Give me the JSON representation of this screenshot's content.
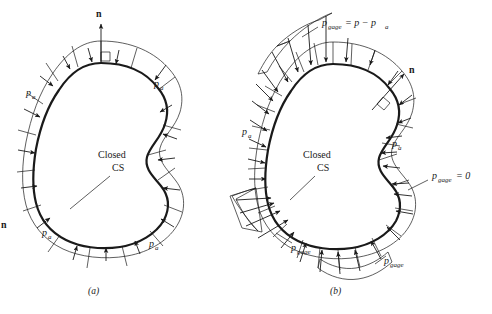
{
  "figure": {
    "type": "pressure-distribution-on-closed-control-surface",
    "background_color": "#ffffff",
    "line_color": "#1a1a1a",
    "stray_left_label": "n"
  },
  "panels": [
    {
      "id": "a",
      "caption": "(a)",
      "caption_x": 91,
      "caption_y": 291,
      "normal_vector": {
        "label": "n",
        "x": 101,
        "y": 20,
        "direction": "up"
      },
      "interior_label": {
        "line1": "Closed",
        "line2": "CS",
        "x": 120,
        "y": 160
      },
      "pressure_labels": [
        {
          "base": "p",
          "sub": "a",
          "x": 30,
          "y": 92
        },
        {
          "base": "p",
          "sub": "a",
          "x": 158,
          "y": 83
        },
        {
          "base": "p",
          "sub": "a",
          "x": 46,
          "y": 232
        },
        {
          "base": "p",
          "sub": "a",
          "x": 153,
          "y": 243
        }
      ],
      "description": "Uniform atmospheric pressure p_a acting inward everywhere on the closed control surface"
    },
    {
      "id": "b",
      "caption": "(b)",
      "caption_x": 333,
      "caption_y": 291,
      "normal_vector": {
        "label": "n",
        "x": 404,
        "y": 72,
        "direction": "up-right"
      },
      "interior_label": {
        "line1": "Closed",
        "line2": "CS",
        "x": 325,
        "y": 160
      },
      "pressure_labels": [
        {
          "base": "p",
          "sub": "a",
          "x": 246,
          "y": 131
        },
        {
          "base": "p",
          "sub": "a",
          "x": 396,
          "y": 143
        },
        {
          "base": "p",
          "sub": "gage",
          "x": 295,
          "y": 247
        },
        {
          "base": "p",
          "sub": "gage",
          "x": 388,
          "y": 260
        }
      ],
      "equations": [
        {
          "base": "p",
          "sub": "gage",
          "rhs": "= p − p",
          "rhs_sub": "a",
          "x": 322,
          "y": 23
        },
        {
          "base": "p",
          "sub": "gage",
          "rhs": "= 0",
          "rhs_sub": "",
          "x": 432,
          "y": 178
        }
      ],
      "description": "Non-uniform gage pressure distribution p_gage = p − p_a; zero gage pressure region on the right"
    }
  ]
}
